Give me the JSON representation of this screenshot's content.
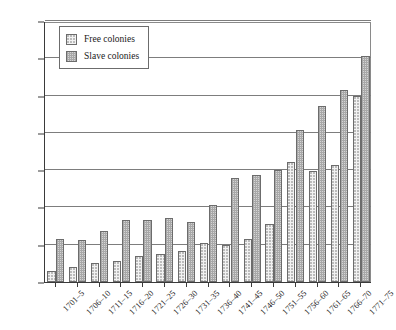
{
  "chart_data": {
    "type": "bar",
    "title": "",
    "xlabel": "",
    "ylabel": "£000",
    "ylim": [
      0,
      2800
    ],
    "yticks": [
      0,
      400,
      800,
      1200,
      1600,
      2000,
      2400,
      2800
    ],
    "grid": true,
    "legend_position": "top-left",
    "categories": [
      "1701–5",
      "1706–10",
      "1711–15",
      "1716–20",
      "1721–25",
      "1726–30",
      "1731–35",
      "1736–40",
      "1741–45",
      "1746–50",
      "1751–55",
      "1756–60",
      "1761–65",
      "1766–70",
      "1771–75"
    ],
    "series": [
      {
        "name": "Free colonies",
        "values": [
          120,
          160,
          205,
          225,
          280,
          300,
          330,
          420,
          395,
          465,
          625,
          1290,
          1195,
          1260,
          2000
        ]
      },
      {
        "name": "Slave colonies",
        "values": [
          465,
          455,
          545,
          660,
          665,
          685,
          640,
          830,
          1120,
          1150,
          1200,
          1635,
          1890,
          2060,
          2430
        ]
      }
    ]
  },
  "legend": {
    "items": [
      {
        "label": "Free colonies",
        "swatch": "free"
      },
      {
        "label": "Slave colonies",
        "swatch": "slave"
      }
    ]
  }
}
